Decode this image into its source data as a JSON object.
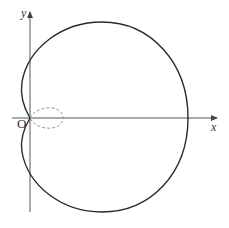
{
  "diagram": {
    "type": "polar curve (limaçon / cardioid-like) with dashed inner loop",
    "labels": {
      "y_axis": "y",
      "x_axis": "x",
      "origin": "O"
    },
    "colors": {
      "curve": "#2a2a2a",
      "axes": "#555555",
      "dashed_loop": "#999999"
    }
  }
}
